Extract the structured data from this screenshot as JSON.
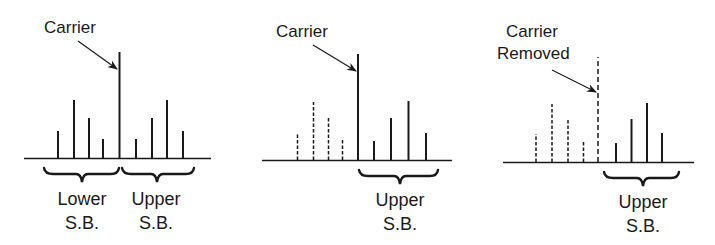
{
  "colors": {
    "ink": "#1a1a1a",
    "background": "#ffffff"
  },
  "panels": [
    {
      "id": "dsb-full-carrier",
      "carrier_label": [
        "Carrier"
      ],
      "carrier_style": "solid",
      "lower_sidebands_style": "solid",
      "upper_sidebands_style": "solid",
      "brace_labels": [
        {
          "line1": "Lower",
          "line2": "S.B."
        },
        {
          "line1": "Upper",
          "line2": "S.B."
        }
      ]
    },
    {
      "id": "ssb-with-carrier",
      "carrier_label": [
        "Carrier"
      ],
      "carrier_style": "solid",
      "lower_sidebands_style": "dashed",
      "upper_sidebands_style": "solid",
      "brace_labels": [
        {
          "line1": "Upper",
          "line2": "S.B."
        }
      ]
    },
    {
      "id": "ssb-suppressed-carrier",
      "carrier_label": [
        "Carrier",
        "Removed"
      ],
      "carrier_style": "dashed",
      "lower_sidebands_style": "dashed",
      "upper_sidebands_style": "solid",
      "brace_labels": [
        {
          "line1": "Upper",
          "line2": "S.B."
        }
      ]
    }
  ],
  "spectral_lines_relative_heights": {
    "lower_sidebands": [
      0.27,
      0.55,
      0.39,
      0.18
    ],
    "carrier": 1.0,
    "upper_sidebands": [
      0.18,
      0.39,
      0.55,
      0.27
    ]
  }
}
